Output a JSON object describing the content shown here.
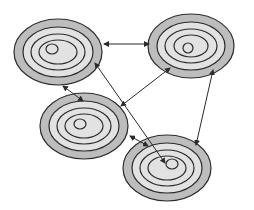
{
  "diagram": {
    "type": "network-of-concentric-ellipses",
    "colors": {
      "background": "#ffffff",
      "outer_ring_fill": "#bdbdbd",
      "inner_fill": "#e2e2e2",
      "stroke": "#2b2b2b",
      "arrow": "#2b2b2b"
    },
    "nodes": [
      {
        "id": "top-left",
        "cx": 58,
        "cy": 52,
        "rings": [
          [
            44,
            33
          ],
          [
            35,
            25
          ],
          [
            27,
            18
          ],
          [
            19,
            12
          ]
        ],
        "dot": {
          "cx": 52,
          "cy": 49,
          "rx": 6,
          "ry": 5
        }
      },
      {
        "id": "top-right",
        "cx": 191,
        "cy": 46,
        "rings": [
          [
            43,
            32
          ],
          [
            34,
            24
          ],
          [
            26,
            17
          ],
          [
            17,
            11
          ]
        ],
        "dot": {
          "cx": 188,
          "cy": 48,
          "rx": 5,
          "ry": 5
        }
      },
      {
        "id": "middle-left",
        "cx": 84,
        "cy": 126,
        "rings": [
          [
            44,
            33
          ],
          [
            35,
            25
          ],
          [
            27,
            18
          ],
          [
            19,
            12
          ]
        ],
        "dot": {
          "cx": 80,
          "cy": 124,
          "rx": 6,
          "ry": 5
        }
      },
      {
        "id": "bottom-right",
        "cx": 167,
        "cy": 168,
        "rings": [
          [
            44,
            33
          ],
          [
            35,
            25
          ],
          [
            27,
            18
          ],
          [
            19,
            12
          ]
        ],
        "dot": {
          "cx": 172,
          "cy": 164,
          "rx": 6,
          "ry": 5
        }
      }
    ],
    "edges": [
      {
        "from": "top-left",
        "to": "top-right",
        "x1": 104,
        "y1": 44,
        "x2": 149,
        "y2": 44,
        "bidirectional": true
      },
      {
        "from": "top-left",
        "to": "middle-left",
        "x1": 63,
        "y1": 86,
        "x2": 83,
        "y2": 101,
        "bidirectional": true
      },
      {
        "from": "top-left",
        "to": "bottom-right",
        "x1": 95,
        "y1": 63,
        "x2": 165,
        "y2": 163,
        "bidirectional": true
      },
      {
        "from": "top-right",
        "to": "middle-left",
        "x1": 170,
        "y1": 68,
        "x2": 121,
        "y2": 106,
        "bidirectional": true
      },
      {
        "from": "top-right",
        "to": "bottom-right",
        "x1": 213,
        "y1": 70,
        "x2": 196,
        "y2": 145,
        "bidirectional": true
      },
      {
        "from": "middle-left",
        "to": "bottom-right",
        "x1": 130,
        "y1": 136,
        "x2": 148,
        "y2": 146,
        "bidirectional": true
      }
    ]
  }
}
